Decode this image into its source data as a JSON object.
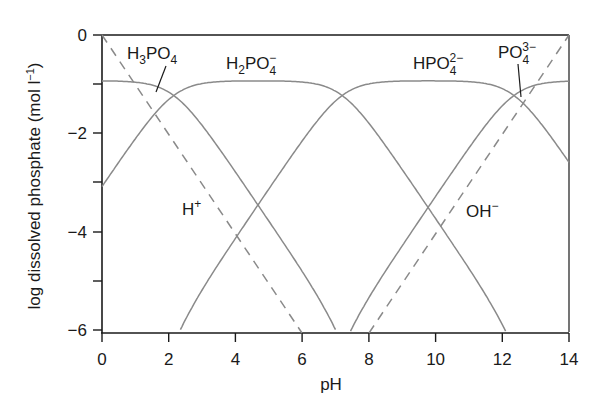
{
  "chart_data": {
    "type": "line",
    "title": "",
    "xlabel": "pH",
    "ylabel": "log dissolved phosphate (mol l⁻¹)",
    "xlim": [
      0,
      14
    ],
    "ylim": [
      -6,
      0
    ],
    "x_ticks": [
      "0",
      "2",
      "4",
      "6",
      "8",
      "10",
      "12",
      "14"
    ],
    "y_ticks": [
      "0",
      "-2",
      "-4",
      "-6"
    ],
    "y_minor_ticks": [
      -1,
      -3,
      -5
    ],
    "grid": false,
    "legend": null,
    "total_log_phosphate": -0.93,
    "pKa": [
      2.15,
      7.2,
      12.35
    ],
    "series": [
      {
        "name": "H3PO4",
        "style": "solid",
        "points": [
          [
            0,
            -0.96
          ],
          [
            1,
            -1.03
          ],
          [
            2,
            -1.43
          ],
          [
            2.15,
            -1.53
          ],
          [
            3,
            -2.1
          ],
          [
            4,
            -3.0
          ],
          [
            5,
            -3.95
          ],
          [
            6,
            -4.95
          ],
          [
            7,
            -5.95
          ],
          [
            7.05,
            -6.0
          ]
        ]
      },
      {
        "name": "H2PO4-",
        "style": "solid",
        "points": [
          [
            0,
            -3.08
          ],
          [
            1,
            -2.16
          ],
          [
            2,
            -1.33
          ],
          [
            2.15,
            -1.23
          ],
          [
            3,
            -1.0
          ],
          [
            4,
            -0.94
          ],
          [
            4.7,
            -0.93
          ],
          [
            5,
            -0.94
          ],
          [
            6,
            -1.0
          ],
          [
            7,
            -1.3
          ],
          [
            7.2,
            -1.23
          ],
          [
            8,
            -1.8
          ],
          [
            9,
            -2.75
          ],
          [
            10,
            -3.73
          ],
          [
            11,
            -4.73
          ],
          [
            12,
            -5.73
          ],
          [
            12.3,
            -6.0
          ]
        ]
      },
      {
        "name": "HPO4 2-",
        "style": "solid",
        "points": [
          [
            2.2,
            -6.0
          ],
          [
            3,
            -5.15
          ],
          [
            4,
            -4.15
          ],
          [
            5,
            -3.15
          ],
          [
            6,
            -2.2
          ],
          [
            7,
            -1.45
          ],
          [
            7.2,
            -1.23
          ],
          [
            8,
            -1.0
          ],
          [
            9,
            -0.95
          ],
          [
            9.8,
            -0.93
          ],
          [
            10,
            -0.94
          ],
          [
            11,
            -1.0
          ],
          [
            12,
            -1.5
          ],
          [
            12.35,
            -1.23
          ],
          [
            13,
            -2.0
          ],
          [
            14,
            -2.65
          ]
        ]
      },
      {
        "name": "PO4 3-",
        "style": "solid",
        "points": [
          [
            7.3,
            -6.0
          ],
          [
            8,
            -5.3
          ],
          [
            9,
            -4.3
          ],
          [
            10,
            -3.3
          ],
          [
            11,
            -2.3
          ],
          [
            12,
            -1.55
          ],
          [
            12.35,
            -1.23
          ],
          [
            13,
            -1.2
          ],
          [
            14,
            -1.1
          ]
        ]
      },
      {
        "name": "H+",
        "style": "dashed",
        "points": [
          [
            0,
            0
          ],
          [
            6,
            -6
          ]
        ]
      },
      {
        "name": "OH-",
        "style": "dashed",
        "points": [
          [
            8,
            -6
          ],
          [
            14,
            0
          ]
        ]
      }
    ],
    "annotations": [
      {
        "text": "H3PO4",
        "x": 1.6,
        "y": -0.35
      },
      {
        "text": "H2PO4-",
        "x": 4.5,
        "y": -0.55
      },
      {
        "text": "HPO4 2-",
        "x": 10.2,
        "y": -0.55
      },
      {
        "text": "PO4 3-",
        "x": 12.7,
        "y": -0.35
      },
      {
        "text": "H+",
        "x": 2.5,
        "y": -3.8
      },
      {
        "text": "OH-",
        "x": 11.0,
        "y": -3.8
      }
    ]
  },
  "labels": {
    "x_axis": "pH",
    "y_axis": "log dissolved phosphate (mol l",
    "y_axis_sup": "−1",
    "y_axis_close": ")",
    "h3po4_main": "H",
    "h3po4_sub1": "3",
    "h3po4_mid": "PO",
    "h3po4_sub2": "4",
    "h2po4_main": "H",
    "h2po4_sub1": "2",
    "h2po4_mid": "PO",
    "h2po4_sub2": "4",
    "h2po4_sup": "−",
    "hpo4_main": "HPO",
    "hpo4_sub": "4",
    "hpo4_sup": "2−",
    "po4_main": "PO",
    "po4_sub": "4",
    "po4_sup": "3−",
    "hplus_main": "H",
    "hplus_sup": "+",
    "ohminus_main": "OH",
    "ohminus_sup": "−"
  },
  "ticks": {
    "x": [
      "0",
      "2",
      "4",
      "6",
      "8",
      "10",
      "12",
      "14"
    ],
    "y": [
      "0",
      "−2",
      "−4",
      "−6"
    ]
  },
  "colors": {
    "axis": "#1a1a1a",
    "curve": "#8a8a8a",
    "dashed": "#8a8a8a"
  }
}
